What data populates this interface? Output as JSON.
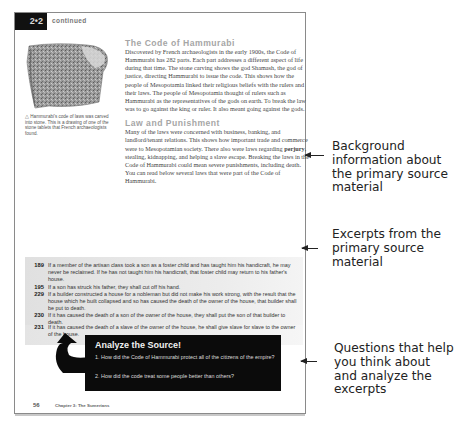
{
  "header": {
    "lesson_number": "2•2",
    "continued_label": "continued"
  },
  "image": {
    "icon": "stone-tablet-image",
    "caption": "△ Hammurabi's code of laws was carved into stone. This is a drawing of one of the stone tablets that French archaeologists found."
  },
  "sections": [
    {
      "heading": "The Code of Hammurabi",
      "body": "Discovered by French archaeologists in the early 1900s, the Code of Hammurabi has 282 parts. Each part addresses a different aspect of life during that time. The stone carving shows the god Shamash, the god of justice, directing Hammurabi to issue the code. This shows how the people of Mesopotamia linked their religious beliefs with the rulers and their laws. The people of Mesopotamia thought of rulers such as Hammurabi as the representatives of the gods on earth. To break the law was to go against the king or ruler. It also meant going against the gods."
    },
    {
      "heading": "Law and Punishment",
      "body_before": "Many of the laws were concerned with business, banking, and landlord/tenant relations. This shows how important trade and commerce were to Mesopotamian society. There also were laws regarding ",
      "bold_term": "perjury",
      "body_after": ", stealing, kidnapping, and helping a slave escape. Breaking the laws in the Code of Hammurabi could mean severe punishments, including death. You can read below several laws that were part of the Code of Hammurabi."
    }
  ],
  "excerpts": [
    {
      "number": "189",
      "text": "If a member of the artisan class took a son as a foster child and has taught him his handicraft, he may never be reclaimed. If he has not taught him his handicraft, that foster child may return to his father's house."
    },
    {
      "number": "195",
      "text": "If a son has struck his father, they shall cut off his hand."
    },
    {
      "number": "229",
      "text": "If a builder constructed a house for a nobleman but did not make his work strong, with the result that the house which he built collapsed and so has caused the death of the owner of the house, that builder shall be put to death."
    },
    {
      "number": "230",
      "text": "If it has caused the death of a son of the owner of the house, they shall put the son of that builder to death."
    },
    {
      "number": "231",
      "text": "If it has caused the death of a slave of the owner of the house, he shall give slave for slave to the owner of the house."
    }
  ],
  "analyze": {
    "title": "Analyze the Source!",
    "questions": [
      "1. How did the Code of Hammurabi protect all of the citizens of the empire?",
      "2. How did the code treat some people better than others?"
    ]
  },
  "footer": {
    "page_number": "56",
    "chapter": "Chapter 3: The Sumerians"
  },
  "annotations": [
    {
      "label": "Background information about the primary source material"
    },
    {
      "label": "Excerpts from the primary source material"
    },
    {
      "label": "Questions that help you think about and analyze the excerpts"
    }
  ],
  "colors": {
    "heading_gray": "#a6a6a6",
    "box_black": "#0b0b0b",
    "excerpt_bg": "#e6e6e6"
  }
}
